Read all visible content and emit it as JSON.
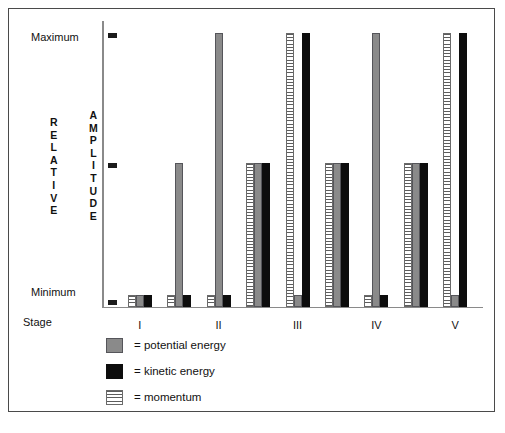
{
  "figure": {
    "stage_axis_label": "Stage",
    "y_axis_words": {
      "first": "RELATIVE",
      "second": "AMPLITUDE"
    },
    "y_ticks": [
      {
        "label": "Maximum",
        "value": 3
      },
      {
        "label": "",
        "value": 2
      },
      {
        "label": "Minimum",
        "value": 1
      }
    ]
  },
  "legend": {
    "position": "below-plot",
    "entries": [
      {
        "swatch": "potential",
        "label": "= potential energy",
        "color": "#8a8a8a"
      },
      {
        "swatch": "kinetic",
        "label": "= kinetic energy",
        "color": "#0d0d0d"
      },
      {
        "swatch": "momentum",
        "label": "= momentum",
        "color": "#5d5d5d"
      }
    ]
  },
  "chart_data": {
    "type": "bar",
    "title": "",
    "subtitle": "",
    "xlabel": "Stage",
    "ylabel": "RELATIVE AMPLITUDE",
    "grid": false,
    "legend_position": "below",
    "ylim": [
      0,
      3
    ],
    "ytick_labels": [
      "Minimum",
      "",
      "Maximum"
    ],
    "ytick_values": [
      1,
      2,
      3
    ],
    "categories": [
      "I",
      "",
      "II",
      "",
      "III",
      "",
      "IV",
      "",
      "V"
    ],
    "stage_tick_labels": [
      "I",
      "II",
      "III",
      "IV",
      "V"
    ],
    "stage_tick_group_index": [
      0,
      2,
      4,
      6,
      8
    ],
    "series": [
      {
        "name": "momentum",
        "color": "#5d5d5d",
        "pattern": "horizontal-lines",
        "values": [
          1,
          1,
          1,
          2,
          3,
          2,
          1,
          2,
          3
        ]
      },
      {
        "name": "potential energy",
        "color": "#8a8a8a",
        "pattern": "solid",
        "values": [
          1,
          2,
          3,
          2,
          1,
          2,
          3,
          2,
          1
        ]
      },
      {
        "name": "kinetic energy",
        "color": "#0d0d0d",
        "pattern": "solid",
        "values": [
          1,
          1,
          1,
          2,
          3,
          2,
          1,
          2,
          3
        ]
      }
    ]
  }
}
